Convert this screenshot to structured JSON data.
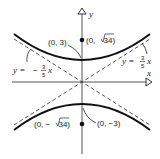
{
  "diagram": {
    "type": "hyperbola",
    "equation_implied": "y^2/9 - x^2/25 = 1",
    "axes": {
      "x_label": "x",
      "y_label": "y"
    },
    "vertices": [
      {
        "label": "(0, 3)"
      },
      {
        "label": "(0, −3)"
      }
    ],
    "foci": [
      {
        "label_pre": "(0, ",
        "radicand": "34",
        "label_post": ")"
      },
      {
        "label_pre": "(0, − ",
        "radicand": "34",
        "label_post": ")"
      }
    ],
    "asymptotes": [
      {
        "lhs": "y = ",
        "sign": "",
        "num": "3",
        "den": "5",
        "var": "x"
      },
      {
        "lhs": "y = ",
        "sign": "−",
        "num": "3",
        "den": "5",
        "var": "x"
      }
    ],
    "colors": {
      "curve": "#111111",
      "axis": "#333333",
      "asymptote": "#444444"
    }
  }
}
